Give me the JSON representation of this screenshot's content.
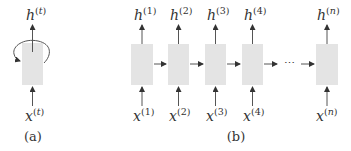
{
  "diagram": {
    "type": "rnn-unrolling",
    "colors": {
      "cell": "#e4e4e4",
      "line": "#555555",
      "text": "#333333"
    },
    "panel_a": {
      "caption": "(a)",
      "cell": {
        "input": {
          "base": "x",
          "sup": "t"
        },
        "output": {
          "base": "h",
          "sup": "t"
        },
        "self_loop": true
      }
    },
    "panel_b": {
      "caption": "(b)",
      "ellipsis": "⋯",
      "cells": [
        {
          "input": {
            "base": "x",
            "sup": "1"
          },
          "output": {
            "base": "h",
            "sup": "1"
          }
        },
        {
          "input": {
            "base": "x",
            "sup": "2"
          },
          "output": {
            "base": "h",
            "sup": "2"
          }
        },
        {
          "input": {
            "base": "x",
            "sup": "3"
          },
          "output": {
            "base": "h",
            "sup": "3"
          }
        },
        {
          "input": {
            "base": "x",
            "sup": "4"
          },
          "output": {
            "base": "h",
            "sup": "4"
          }
        },
        {
          "input": {
            "base": "x",
            "sup": "n"
          },
          "output": {
            "base": "h",
            "sup": "n"
          }
        }
      ]
    },
    "paren_open": "(",
    "paren_close": ")"
  }
}
